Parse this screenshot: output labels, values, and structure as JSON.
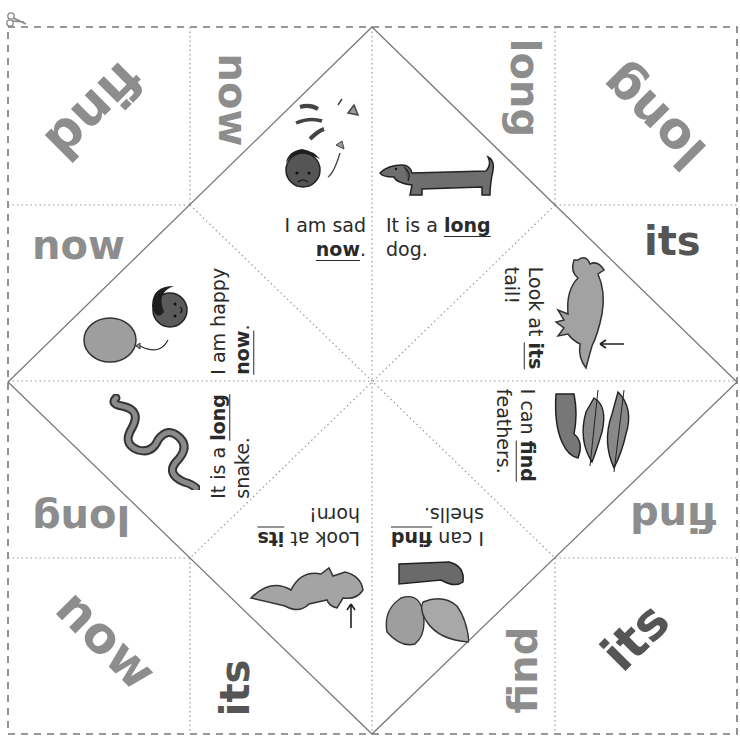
{
  "worksheet": {
    "type": "fortune teller (cootie catcher) cut-out",
    "colors": {
      "sight_word_light": "#8d8d8d",
      "sight_word_dark": "#555555",
      "fold_line": "#9a9a9a",
      "cut_line": "#777777",
      "text": "#2a2a2a"
    },
    "cut_icon": "scissors-icon",
    "outer_flaps": [
      {
        "id": "top-left-corner",
        "word": "find",
        "rotation": 135
      },
      {
        "id": "top-left-side",
        "word": "now",
        "rotation": 90
      },
      {
        "id": "left-top-side",
        "word": "now",
        "rotation": 0
      },
      {
        "id": "top-right-side",
        "word": "long",
        "rotation": 90
      },
      {
        "id": "top-right-corner",
        "word": "long",
        "rotation": 225
      },
      {
        "id": "right-top-side",
        "word": "its",
        "rotation": 0
      },
      {
        "id": "left-bottom-side",
        "word": "long",
        "rotation": 180
      },
      {
        "id": "bottom-left-corner",
        "word": "now",
        "rotation": 45
      },
      {
        "id": "bottom-left-side",
        "word": "its",
        "rotation": 270
      },
      {
        "id": "right-bottom-side",
        "word": "find",
        "rotation": 180
      },
      {
        "id": "bottom-right-side",
        "word": "find",
        "rotation": 270
      },
      {
        "id": "bottom-right-corner",
        "word": "its",
        "rotation": 315
      }
    ],
    "inner_panels": [
      {
        "id": "sad",
        "prefix": "I am sad",
        "keyword": "now",
        "suffix": ".",
        "picture": "sad-boy-icon"
      },
      {
        "id": "dog",
        "prefix": "It is a",
        "keyword": "long",
        "suffix": "dog.",
        "picture": "dachshund-icon"
      },
      {
        "id": "happy",
        "prefix": "I am happy",
        "keyword": "now",
        "suffix": ".",
        "picture": "happy-boy-balloon-icon"
      },
      {
        "id": "tail",
        "prefix": "Look at",
        "keyword": "its",
        "suffix": "tail!",
        "picture": "dinosaur-tail-icon"
      },
      {
        "id": "snake",
        "prefix": "It is a",
        "keyword": "long",
        "suffix": "snake.",
        "picture": "snake-icon"
      },
      {
        "id": "feathers",
        "prefix": "I can",
        "keyword": "find",
        "suffix": "feathers.",
        "picture": "hand-feathers-icon"
      },
      {
        "id": "horn",
        "prefix": "Look at",
        "keyword": "its",
        "suffix": "horn!",
        "picture": "triceratops-horn-icon"
      },
      {
        "id": "shells",
        "prefix": "I can",
        "keyword": "find",
        "suffix": "shells.",
        "picture": "hand-shells-icon"
      }
    ]
  }
}
